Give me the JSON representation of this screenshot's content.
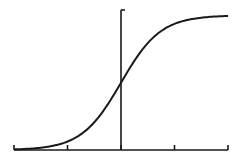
{
  "chart_data": {
    "type": "line",
    "title": "",
    "xlabel": "",
    "ylabel": "",
    "x": [
      -6,
      -5,
      -4,
      -3,
      -2,
      -1.5,
      -1,
      -0.5,
      0,
      0.5,
      1,
      1.5,
      2,
      3,
      4,
      5,
      6
    ],
    "series": [
      {
        "name": "sigmoid",
        "values": [
          0.0025,
          0.0067,
          0.018,
          0.047,
          0.119,
          0.182,
          0.269,
          0.378,
          0.5,
          0.622,
          0.731,
          0.818,
          0.881,
          0.953,
          0.982,
          0.993,
          0.9975
        ]
      }
    ],
    "xlim": [
      -6,
      6
    ],
    "ylim": [
      0,
      1.04
    ],
    "x_ticks": [
      -6,
      -3,
      0,
      3,
      6
    ],
    "tick_labels": [],
    "grid": false,
    "legend": "none",
    "color": "#1a1a1a"
  }
}
